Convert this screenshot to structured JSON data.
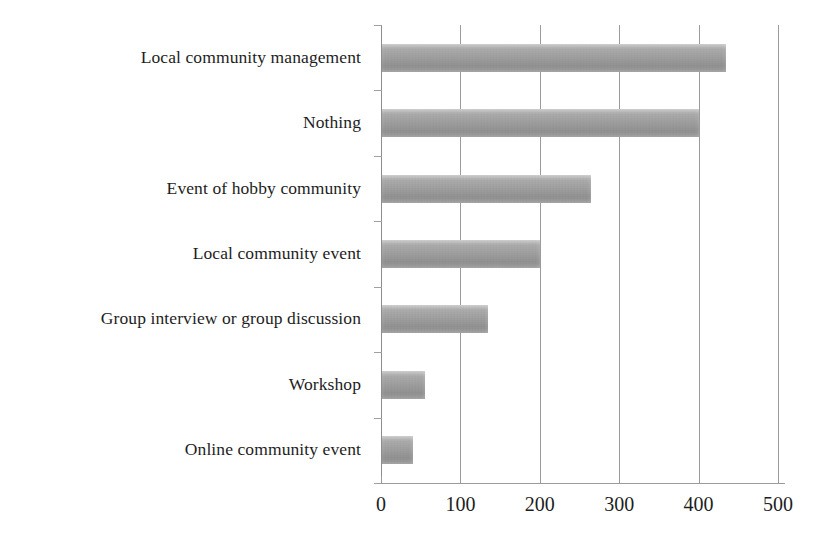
{
  "chart_data": {
    "type": "bar",
    "orientation": "horizontal",
    "title": "",
    "subtitle": "",
    "xlabel": "",
    "ylabel": "",
    "xlim": [
      0,
      500
    ],
    "ylim": null,
    "grid": "vertical",
    "legend": "none",
    "xticks": [
      0,
      100,
      200,
      300,
      400,
      500
    ],
    "xtick_labels": [
      "0",
      "100",
      "200",
      "300",
      "400",
      "500"
    ],
    "bar_color": "#9d9d9d",
    "background_color": "#ffffff",
    "axis_color": "#9b9b9b",
    "categories": [
      "Local community management",
      "Nothing",
      "Event of hobby community",
      "Local community event",
      "Group interview or group discussion",
      "Workshop",
      "Online community event"
    ],
    "values": [
      434,
      400,
      265,
      200,
      135,
      55,
      40
    ]
  },
  "axis": {
    "x_ticks": [
      {
        "label": "0",
        "value": 0
      },
      {
        "label": "100",
        "value": 100
      },
      {
        "label": "200",
        "value": 200
      },
      {
        "label": "300",
        "value": 300
      },
      {
        "label": "400",
        "value": 400
      },
      {
        "label": "500",
        "value": 500
      }
    ]
  }
}
